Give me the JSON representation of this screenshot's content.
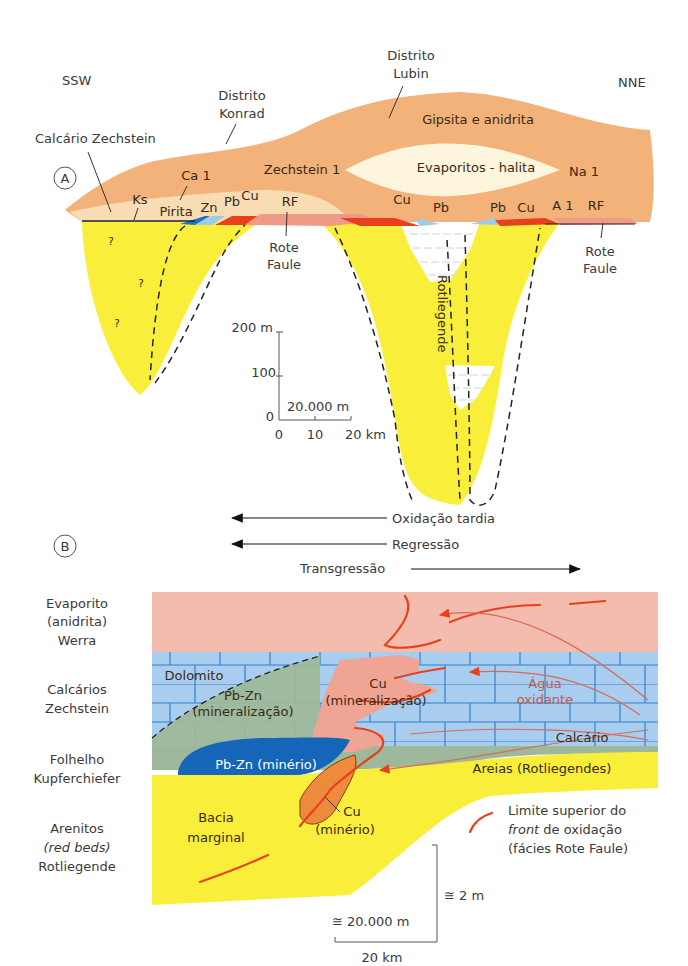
{
  "panel_a": {
    "marker": "A",
    "orientation": {
      "left": "SSW",
      "right": "NNE"
    },
    "district_konrad": [
      "Distrito",
      "Konrad"
    ],
    "district_lubin": [
      "Distrito",
      "Lubin"
    ],
    "calcario_zechstein": "Calcário Zechstein",
    "gipsita": "Gipsita e anidrita",
    "zechstein1": "Zechstein 1",
    "evaporitos": "Evaporitos - halita",
    "na1": "Na 1",
    "ca1": "Ca 1",
    "ks": "Ks",
    "pirita": "Pirita",
    "zn": "Zn",
    "pb_left": "Pb",
    "cu_left": "Cu",
    "rf_left": "RF",
    "cu_mid": "Cu",
    "pb_mid1": "Pb",
    "pb_mid2": "Pb",
    "cu_mid2": "Cu",
    "a1": "A 1",
    "rf_right": "RF",
    "rote_faule_left": [
      "Rote",
      "Faule"
    ],
    "rote_faule_right": [
      "Rote",
      "Faule"
    ],
    "rotliegende": "Rotliegende",
    "question": "?",
    "scale": {
      "vertical_top": "200 m",
      "vertical_mid": "100",
      "vertical_zero": "0",
      "horizontal_label": "20.000 m",
      "ticks": [
        "0",
        "10",
        "20 km"
      ]
    }
  },
  "arrows": {
    "oxidacao": "Oxidação tardia",
    "regressao": "Regressão",
    "transgressao": "Transgressão"
  },
  "panel_b": {
    "marker": "B",
    "left_labels": [
      [
        "Evaporito",
        "(anidrita)",
        "Werra"
      ],
      [
        "Calcários",
        "Zechstein"
      ],
      [
        "Folhelho",
        "Kupferchiefer"
      ],
      [
        "Arenitos",
        "(red beds)",
        "Rotliegende"
      ]
    ],
    "dolomito": "Dolomito",
    "pbzn_mineral": [
      "Pb-Zn",
      "(mineralização)"
    ],
    "cu_mineral": [
      "Cu",
      "(mineralização)"
    ],
    "agua": [
      "Água",
      "oxidante"
    ],
    "calcario": "Calcário",
    "pbzn_minerio": "Pb-Zn (minério)",
    "areias": "Areias (Rotliegendes)",
    "bacia": [
      "Bacia",
      "marginal"
    ],
    "cu_minerio": [
      "Cu",
      "(minério)"
    ],
    "legend": {
      "line1": "Limite superior do",
      "line2_italic": "front",
      "line2_rest": " de oxidação",
      "line3": "(fácies Rote Faule)"
    },
    "scale": {
      "vertical": "≅ 2 m",
      "horizontal": "≅ 20.000 m",
      "bottom": "20 km"
    }
  },
  "colors": {
    "tan": "#f2b27a",
    "cream": "#fdf6dc",
    "lightcream": "#f8dcb4",
    "yellow": "#f9ee3a",
    "red": "#e8401c",
    "salmon": "#ee9a86",
    "pink": "#f4bcae",
    "blue": "#a9cdef",
    "darkblue": "#1565b8",
    "lightblue": "#9dcbe8",
    "green": "#9db89a",
    "orange": "#ee8a3c"
  }
}
